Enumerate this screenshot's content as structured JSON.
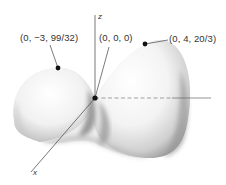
{
  "figure": {
    "type": "3d-surface-diagram",
    "axes": {
      "z": "z",
      "x": "x",
      "y": ""
    },
    "points": [
      {
        "id": "left-peak",
        "label": "(0, −3, 99/32)",
        "kind": "local maximum"
      },
      {
        "id": "origin",
        "label": "(0, 0, 0)",
        "kind": "saddle point"
      },
      {
        "id": "right-peak",
        "label": "(0, 4, 20/3)",
        "kind": "local maximum"
      }
    ],
    "colors": {
      "surface_light": "#fafafa",
      "surface_shadow": "#8a8a8a",
      "axis": "#555555",
      "point": "#111111",
      "text": "#333333"
    }
  }
}
